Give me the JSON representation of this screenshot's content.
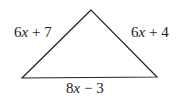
{
  "diagram": {
    "type": "triangle",
    "vertices": {
      "apex": [
        91,
        10
      ],
      "bottom_left": [
        22,
        78
      ],
      "bottom_right": [
        157,
        77
      ]
    },
    "stroke_color": "#222222",
    "sides": {
      "left": {
        "coef": "6",
        "var": "x",
        "rest": " + 7"
      },
      "right": {
        "coef": "6",
        "var": "x",
        "rest": " + 4"
      },
      "bottom": {
        "coef": "8",
        "var": "x",
        "rest": " − 3"
      }
    }
  }
}
